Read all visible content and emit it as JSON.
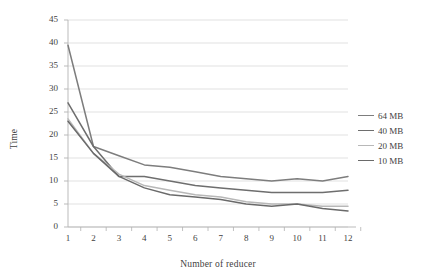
{
  "chart_data": {
    "type": "line",
    "title": "",
    "xlabel": "Number of reducer",
    "ylabel": "Time",
    "x": [
      1,
      2,
      3,
      4,
      5,
      6,
      7,
      8,
      9,
      10,
      11,
      12
    ],
    "xtick_labels": [
      "1",
      "2",
      "3",
      "4",
      "5",
      "6",
      "7",
      "8",
      "9",
      "10",
      "11",
      "12"
    ],
    "ytick_labels": [
      "0",
      "5",
      "10",
      "15",
      "20",
      "25",
      "30",
      "35",
      "40",
      "45"
    ],
    "yticks": [
      0,
      5,
      10,
      15,
      20,
      25,
      30,
      35,
      40,
      45
    ],
    "ylim": [
      0,
      45
    ],
    "xlim": [
      1,
      12
    ],
    "grid": "horizontal",
    "legend_position": "right",
    "series": [
      {
        "name": "64 MB",
        "color": "#7d7d7d",
        "values": [
          39.5,
          17.5,
          15.5,
          13.5,
          13.0,
          12.0,
          11.0,
          10.5,
          10.0,
          10.5,
          10.0,
          11.0
        ]
      },
      {
        "name": "40 MB",
        "color": "#6e6e6e",
        "values": [
          27.0,
          17.5,
          11.0,
          11.0,
          10.0,
          9.0,
          8.5,
          8.0,
          7.5,
          7.5,
          7.5,
          8.0
        ]
      },
      {
        "name": "20 MB",
        "color": "#b8b8b8",
        "values": [
          23.5,
          16.0,
          11.5,
          9.0,
          8.0,
          7.0,
          6.5,
          5.5,
          5.0,
          5.0,
          4.5,
          4.5
        ]
      },
      {
        "name": "10 MB",
        "color": "#6a6a6a",
        "values": [
          23.0,
          16.0,
          11.0,
          8.5,
          7.0,
          6.5,
          6.0,
          5.0,
          4.5,
          5.0,
          4.0,
          3.5
        ]
      }
    ]
  },
  "style": {
    "grid_color": "#d9d9d9",
    "axis_color": "#b3b3b3",
    "text_color": "#3f3f3f",
    "plot_background": "#ffffff"
  }
}
